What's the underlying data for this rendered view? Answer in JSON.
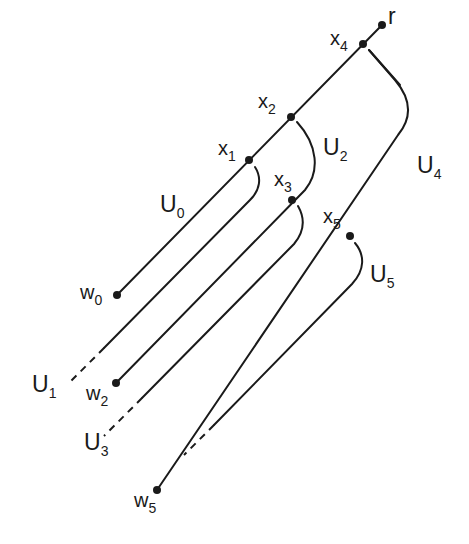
{
  "diagram": {
    "type": "tree-decomposition",
    "nodes": {
      "r": {
        "base": "r",
        "sub": ""
      },
      "x4": {
        "base": "x",
        "sub": "4"
      },
      "x2": {
        "base": "x",
        "sub": "2"
      },
      "x1": {
        "base": "x",
        "sub": "1"
      },
      "x3": {
        "base": "x",
        "sub": "3"
      },
      "x5": {
        "base": "x",
        "sub": "5"
      },
      "w0": {
        "base": "w",
        "sub": "0"
      },
      "w2": {
        "base": "w",
        "sub": "2"
      },
      "w5": {
        "base": "w",
        "sub": "5"
      }
    },
    "sets": {
      "U0": {
        "base": "U",
        "sub": "0"
      },
      "U1": {
        "base": "U",
        "sub": "1"
      },
      "U2": {
        "base": "U",
        "sub": "2"
      },
      "U3": {
        "base": "U",
        "sub": "3"
      },
      "U4": {
        "base": "U",
        "sub": "4"
      },
      "U5": {
        "base": "U",
        "sub": "5"
      }
    }
  }
}
